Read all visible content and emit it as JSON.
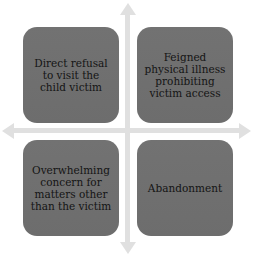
{
  "diagram": {
    "type": "quadrant-matrix",
    "axes": {
      "color": "#e0e0e0",
      "horizontal": "double-headed-arrow",
      "vertical": "double-headed-arrow"
    },
    "box_color": "#6f6f6f",
    "text_color": "#141414",
    "quadrants": [
      {
        "position": "top-left",
        "text": "Direct refusal to visit the child victim"
      },
      {
        "position": "top-right",
        "text": "Feigned physical illness prohibiting victim access"
      },
      {
        "position": "bottom-left",
        "text": "Overwhelming concern for matters other than the victim"
      },
      {
        "position": "bottom-right",
        "text": "Abandonment"
      }
    ]
  }
}
